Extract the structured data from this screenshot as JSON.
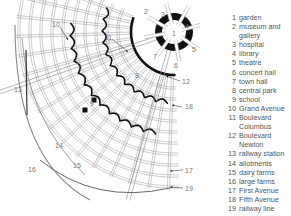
{
  "diagram": {
    "callouts": [
      {
        "n": "1",
        "x": 172,
        "y": 36
      },
      {
        "n": "2",
        "x": 144,
        "y": 14
      },
      {
        "n": "3",
        "x": 161,
        "y": 17
      },
      {
        "n": "4",
        "x": 185,
        "y": 29
      },
      {
        "n": "5",
        "x": 192,
        "y": 52
      },
      {
        "n": "6",
        "x": 174,
        "y": 68
      },
      {
        "n": "7",
        "x": 153,
        "y": 59
      },
      {
        "n": "8",
        "x": 135,
        "y": 78
      },
      {
        "n": "9",
        "x": 90,
        "y": 106
      },
      {
        "n": "10",
        "x": 52,
        "y": 27
      },
      {
        "n": "11",
        "x": 105,
        "y": 40
      },
      {
        "n": "12",
        "x": 182,
        "y": 84
      },
      {
        "n": "13",
        "x": 14,
        "y": 92
      },
      {
        "n": "14",
        "x": 55,
        "y": 148
      },
      {
        "n": "15",
        "x": 73,
        "y": 168
      },
      {
        "n": "16",
        "x": 28,
        "y": 172
      },
      {
        "n": "17",
        "x": 185,
        "y": 173
      },
      {
        "n": "18",
        "x": 185,
        "y": 109
      },
      {
        "n": "19",
        "x": 185,
        "y": 191
      }
    ]
  },
  "legend": {
    "items": [
      {
        "num": "1",
        "label": "garden"
      },
      {
        "num": "2",
        "label": "museum and gallery"
      },
      {
        "num": "3",
        "label": "hospital"
      },
      {
        "num": "4",
        "label": "library"
      },
      {
        "num": "5",
        "label": "theatre"
      },
      {
        "num": "6",
        "label": "concert hall"
      },
      {
        "num": "7",
        "label": "town hall"
      },
      {
        "num": "8",
        "label": "central park"
      },
      {
        "num": "9",
        "label": "school"
      },
      {
        "num": "10",
        "label": "Grand Avenue"
      },
      {
        "num": "11",
        "label": "Boulevard Columbus"
      },
      {
        "num": "12",
        "label": "Boulevard Newton"
      },
      {
        "num": "13",
        "label": "railway station"
      },
      {
        "num": "14",
        "label": "allotments"
      },
      {
        "num": "15",
        "label": "dairy farms"
      },
      {
        "num": "16",
        "label": "large farms"
      },
      {
        "num": "17",
        "label": "First Avenue"
      },
      {
        "num": "18",
        "label": "Fifth Avenue"
      },
      {
        "num": "19",
        "label": "railway line"
      }
    ]
  }
}
